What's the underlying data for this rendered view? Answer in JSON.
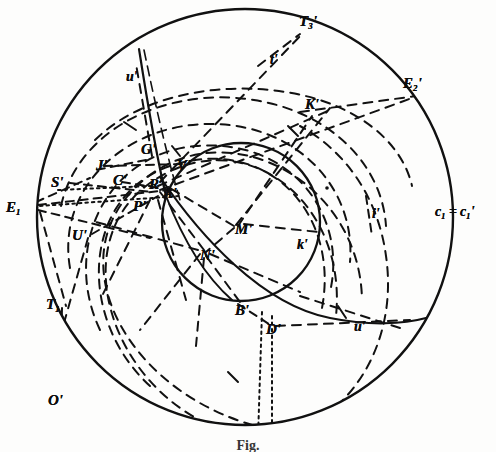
{
  "figure": {
    "caption": "Fig.",
    "background_color": "#fdfdfc",
    "ink_color": "#111111"
  },
  "circles": {
    "outer_label": "c₁ = c₁'",
    "outer_label_plain": "c1 = c1'",
    "inner_label": "k'",
    "outer_center": [
      245,
      217
    ],
    "outer_radius": 208,
    "inner_center": [
      241,
      222
    ],
    "inner_radius": 79
  },
  "labels": [
    {
      "id": "T3p",
      "text": "T",
      "sub": "3",
      "prime": "'",
      "x": 299,
      "y": 14,
      "size": "cap"
    },
    {
      "id": "tp",
      "text": "t",
      "sub": "",
      "prime": "'",
      "x": 270,
      "y": 53,
      "size": "low"
    },
    {
      "id": "E2p",
      "text": "E",
      "sub": "2",
      "prime": "'",
      "x": 403,
      "y": 76,
      "size": "cap"
    },
    {
      "id": "Kp",
      "text": "K",
      "sub": "",
      "prime": "'",
      "x": 305,
      "y": 97,
      "size": "cap"
    },
    {
      "id": "up_top",
      "text": "u",
      "sub": "",
      "prime": "'",
      "x": 126,
      "y": 70,
      "size": "low"
    },
    {
      "id": "Gp",
      "text": "G",
      "sub": "",
      "prime": "'",
      "x": 141,
      "y": 142,
      "size": "cap"
    },
    {
      "id": "Jp",
      "text": "J",
      "sub": "",
      "prime": "'",
      "x": 96,
      "y": 158,
      "size": "cap"
    },
    {
      "id": "Sp",
      "text": "S",
      "sub": "",
      "prime": "'",
      "x": 51,
      "y": 175,
      "size": "cap"
    },
    {
      "id": "Cp",
      "text": "C",
      "sub": "",
      "prime": "'",
      "x": 113,
      "y": 173,
      "size": "cap"
    },
    {
      "id": "Vp",
      "text": "V",
      "sub": "",
      "prime": "'",
      "x": 177,
      "y": 158,
      "size": "cap"
    },
    {
      "id": "Rp",
      "text": "R",
      "sub": "",
      "prime": "'",
      "x": 149,
      "y": 177,
      "size": "cap"
    },
    {
      "id": "Ap",
      "text": "A",
      "sub": "",
      "prime": "'",
      "x": 163,
      "y": 186,
      "size": "cap"
    },
    {
      "id": "Pp",
      "text": "P",
      "sub": "",
      "prime": "'",
      "x": 133,
      "y": 199,
      "size": "cap"
    },
    {
      "id": "E1",
      "text": "E",
      "sub": "1",
      "prime": "",
      "x": 6,
      "y": 200,
      "size": "cap"
    },
    {
      "id": "Up",
      "text": "U",
      "sub": "",
      "prime": "'",
      "x": 72,
      "y": 228,
      "size": "cap"
    },
    {
      "id": "Mp",
      "text": "M",
      "sub": "",
      "prime": "'",
      "x": 235,
      "y": 222,
      "size": "cap"
    },
    {
      "id": "Np",
      "text": "N",
      "sub": "",
      "prime": "'",
      "x": 200,
      "y": 248,
      "size": "cap"
    },
    {
      "id": "kp",
      "text": "k",
      "sub": "",
      "prime": "'",
      "x": 297,
      "y": 238,
      "size": "low"
    },
    {
      "id": "ip",
      "text": "i",
      "sub": "",
      "prime": "'",
      "x": 372,
      "y": 207,
      "size": "low"
    },
    {
      "id": "c1c1",
      "text": "c",
      "sub": "1",
      "prime": "= c₁'",
      "x": 435,
      "y": 205,
      "size": "low",
      "special": "c-pair"
    },
    {
      "id": "T1",
      "text": "T",
      "sub": "1",
      "prime": "",
      "x": 46,
      "y": 297,
      "size": "cap"
    },
    {
      "id": "Bp",
      "text": "B",
      "sub": "",
      "prime": "'",
      "x": 235,
      "y": 303,
      "size": "cap"
    },
    {
      "id": "Dp",
      "text": "D",
      "sub": "",
      "prime": "'",
      "x": 266,
      "y": 322,
      "size": "cap"
    },
    {
      "id": "up_bot",
      "text": "u",
      "sub": "",
      "prime": "'",
      "x": 354,
      "y": 320,
      "size": "low"
    },
    {
      "id": "Op",
      "text": "O",
      "sub": "",
      "prime": "'",
      "x": 48,
      "y": 393,
      "size": "cap"
    }
  ],
  "label_text": {
    "T3p": "T₃'",
    "tp": "t'",
    "E2p": "E₂'",
    "Kp": "K'",
    "up_top": "u'",
    "Gp": "G'",
    "Jp": "J'",
    "Sp": "S'",
    "Cp": "C'",
    "Vp": "V'",
    "Rp": "R'",
    "Ap": "A'",
    "Pp": "P'",
    "E1": "E₁",
    "Up": "U'",
    "Mp": "M'",
    "Np": "N'",
    "kp": "k'",
    "ip": "i'",
    "c1c1": "c₁ = c₁'",
    "T1": "T₁",
    "Bp": "B'",
    "Dp": "D'",
    "up_bot": "u'",
    "Op": "O'"
  },
  "line_styles": {
    "solid": "continuous stroke",
    "dashed": "long dash construction arc",
    "dotted": "fine dotted chord"
  }
}
